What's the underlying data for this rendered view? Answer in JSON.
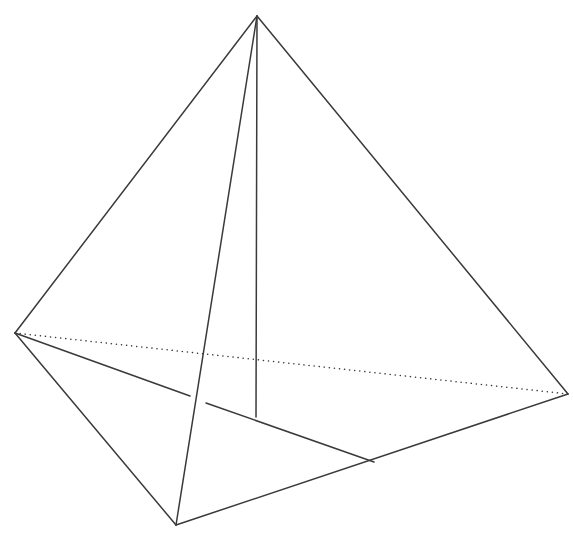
{
  "figure": {
    "name": "tetrahedron-wireframe",
    "canvas": {
      "width": 573,
      "height": 543
    },
    "background_color": "#ffffff",
    "stroke_color": "#3a3a3a",
    "stroke_width": 1.5,
    "dot_stroke_width": 1.5,
    "dot_dash_pattern": "0.1 5",
    "vertices": {
      "apex": {
        "label": "apex",
        "x": 257,
        "y": 16
      },
      "left": {
        "label": "left-base-vertex",
        "x": 15,
        "y": 333
      },
      "right": {
        "label": "right-base-vertex",
        "x": 568,
        "y": 394
      },
      "bottom": {
        "label": "front-base-vertex",
        "x": 176,
        "y": 525
      },
      "foot": {
        "label": "altitude-foot",
        "x": 256,
        "y": 417
      },
      "inner_break_a": {
        "label": "interior-edge-break-start",
        "x": 190,
        "y": 396
      },
      "inner_break_b": {
        "label": "interior-edge-break-end",
        "x": 206,
        "y": 403
      },
      "inner_right": {
        "label": "interior-edge-right-end",
        "x": 374,
        "y": 462
      }
    },
    "edges": [
      {
        "name": "edge-apex-to-left",
        "style": "solid",
        "points": "257,16 15,333"
      },
      {
        "name": "edge-apex-to-right",
        "style": "solid",
        "points": "257,16 568,394"
      },
      {
        "name": "edge-apex-to-bottom",
        "style": "solid",
        "points": "257,16 176,525"
      },
      {
        "name": "edge-left-to-bottom",
        "style": "solid",
        "points": "15,333 176,525"
      },
      {
        "name": "edge-bottom-to-right",
        "style": "solid",
        "points": "176,525 568,394"
      },
      {
        "name": "edge-left-to-right-hidden",
        "style": "dotted",
        "points": "15,333 568,394"
      },
      {
        "name": "edge-altitude-apex-to-foot",
        "style": "solid",
        "points": "257,16 256,417"
      },
      {
        "name": "edge-interior-left-segment",
        "style": "solid",
        "points": "15,333 190,396"
      },
      {
        "name": "edge-interior-right-segment",
        "style": "solid",
        "points": "206,403 374,462"
      }
    ]
  }
}
